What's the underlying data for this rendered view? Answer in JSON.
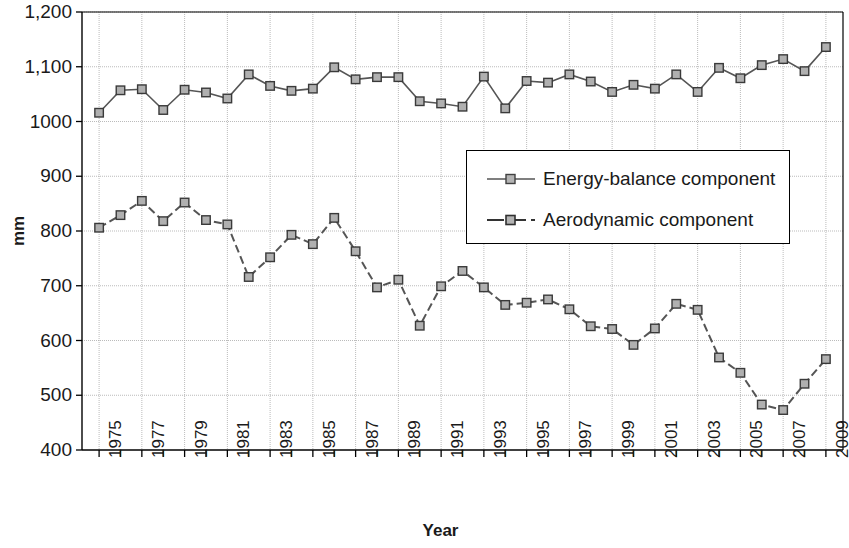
{
  "chart_data": {
    "type": "line",
    "title": "",
    "xlabel": "Year",
    "ylabel": "mm",
    "xlim": [
      1974.2,
      2009.8
    ],
    "ylim": [
      400,
      1200
    ],
    "ytick_labels": [
      "1,200",
      "1,100",
      "1000",
      "900",
      "800",
      "700",
      "600",
      "500",
      "400"
    ],
    "ytick_values": [
      1200,
      1100,
      1000,
      900,
      800,
      700,
      600,
      500,
      400
    ],
    "xtick_labels": [
      "1975",
      "1977",
      "1979",
      "1981",
      "1983",
      "1985",
      "1987",
      "1989",
      "1991",
      "1993",
      "1995",
      "1997",
      "1999",
      "2001",
      "2003",
      "2005",
      "2007",
      "2009"
    ],
    "xtick_values": [
      1975,
      1977,
      1979,
      1981,
      1983,
      1985,
      1987,
      1989,
      1991,
      1993,
      1995,
      1997,
      1999,
      2001,
      2003,
      2005,
      2007,
      2009
    ],
    "grid": true,
    "legend_position": "center-right",
    "x": [
      1975,
      1976,
      1977,
      1978,
      1979,
      1980,
      1981,
      1982,
      1983,
      1984,
      1985,
      1986,
      1987,
      1988,
      1989,
      1990,
      1991,
      1992,
      1993,
      1994,
      1995,
      1996,
      1997,
      1998,
      1999,
      2000,
      2001,
      2002,
      2003,
      2004,
      2005,
      2006,
      2007,
      2008,
      2009
    ],
    "series": [
      {
        "name": "Energy-balance component",
        "style": "solid",
        "marker": "square",
        "color": "#555555",
        "values": [
          1016,
          1057,
          1059,
          1021,
          1058,
          1053,
          1042,
          1086,
          1065,
          1056,
          1060,
          1099,
          1077,
          1081,
          1081,
          1037,
          1033,
          1027,
          1082,
          1024,
          1074,
          1071,
          1086,
          1073,
          1054,
          1067,
          1060,
          1086,
          1054,
          1098,
          1079,
          1103,
          1114,
          1092,
          1136
        ]
      },
      {
        "name": "Aerodynamic component",
        "style": "dashed",
        "marker": "square",
        "color": "#555555",
        "values": [
          806,
          829,
          855,
          818,
          852,
          820,
          812,
          716,
          752,
          793,
          776,
          824,
          763,
          697,
          711,
          627,
          699,
          727,
          697,
          665,
          669,
          675,
          657,
          626,
          621,
          592,
          622,
          667,
          656,
          569,
          541,
          483,
          473,
          521,
          566
        ]
      }
    ]
  },
  "legend": {
    "items": [
      {
        "label": "Energy-balance component"
      },
      {
        "label": "Aerodynamic component"
      }
    ]
  }
}
